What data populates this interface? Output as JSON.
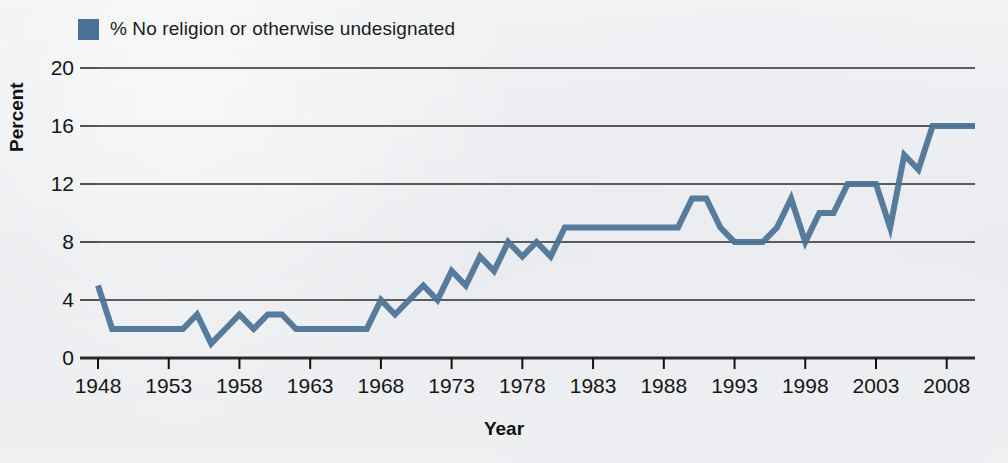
{
  "chart_data": {
    "type": "line",
    "title": "",
    "xlabel": "Year",
    "ylabel": "Percent",
    "legend": [
      {
        "label": "% No religion or otherwise undesignated",
        "color": "#4a7296"
      }
    ],
    "legend_position": "top-left",
    "grid": true,
    "grid_axis": "y",
    "xlim": [
      1948,
      2010
    ],
    "ylim": [
      0,
      20
    ],
    "yticks": [
      0,
      4,
      8,
      12,
      16,
      20
    ],
    "xticks": [
      1948,
      1953,
      1958,
      1963,
      1968,
      1973,
      1978,
      1983,
      1988,
      1993,
      1998,
      2003,
      2008
    ],
    "series": [
      {
        "name": "% No religion or otherwise undesignated",
        "color": "#4a7296",
        "x": [
          1948,
          1949,
          1950,
          1951,
          1952,
          1953,
          1954,
          1955,
          1956,
          1957,
          1958,
          1959,
          1960,
          1961,
          1962,
          1963,
          1964,
          1965,
          1966,
          1967,
          1968,
          1969,
          1970,
          1971,
          1972,
          1973,
          1974,
          1975,
          1976,
          1977,
          1978,
          1979,
          1980,
          1981,
          1982,
          1983,
          1984,
          1985,
          1986,
          1987,
          1988,
          1989,
          1990,
          1991,
          1992,
          1993,
          1994,
          1995,
          1996,
          1997,
          1998,
          1999,
          2000,
          2001,
          2002,
          2003,
          2004,
          2005,
          2006,
          2007,
          2008,
          2009,
          2010
        ],
        "values": [
          5,
          2,
          2,
          2,
          2,
          2,
          2,
          3,
          1,
          2,
          3,
          2,
          3,
          3,
          2,
          2,
          2,
          2,
          2,
          2,
          4,
          3,
          4,
          5,
          4,
          6,
          5,
          7,
          6,
          8,
          7,
          8,
          7,
          9,
          9,
          9,
          9,
          9,
          9,
          9,
          9,
          9,
          11,
          11,
          9,
          8,
          8,
          8,
          9,
          11,
          8,
          10,
          10,
          12,
          12,
          12,
          9,
          14,
          13,
          16,
          16,
          16,
          16
        ]
      }
    ]
  },
  "axes": {
    "y_title": "Percent",
    "x_title": "Year",
    "y_tick_labels": [
      "0",
      "4",
      "8",
      "12",
      "16",
      "20"
    ],
    "x_tick_labels": [
      "1948",
      "1953",
      "1958",
      "1963",
      "1968",
      "1973",
      "1978",
      "1983",
      "1988",
      "1993",
      "1998",
      "2003",
      "2008"
    ]
  },
  "colors": {
    "series": "#4a7296",
    "gridline": "#2b2b2b",
    "axis": "#101010",
    "background": "#eceef0",
    "text": "#161616"
  }
}
